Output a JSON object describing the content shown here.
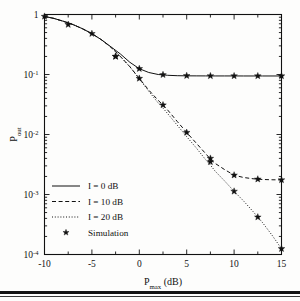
{
  "figure": {
    "background_color": "#fdfdfc",
    "axis_color": "#111111",
    "has_bottom_page_rule": true
  },
  "chart_data": {
    "type": "line",
    "title": "",
    "xlabel": "P_max (dB)",
    "xlabel_main": "P",
    "xlabel_sub": "max",
    "xlabel_unit": " (dB)",
    "ylabel": "P_out",
    "ylabel_main": "P",
    "ylabel_sub": "out",
    "xlim": [
      -10,
      15
    ],
    "ylim": [
      0.0001,
      1
    ],
    "yscale": "log",
    "xscale": "linear",
    "grid": false,
    "legend_position": "lower left",
    "xticks": [
      -10,
      -5,
      0,
      5,
      10,
      15
    ],
    "xtick_labels": [
      "-10",
      "-5",
      "0",
      "5",
      "10",
      "15"
    ],
    "xminor_step": 2.5,
    "yticks": [
      1,
      0.1,
      0.01,
      0.001,
      0.0001
    ],
    "ytick_labels": [
      "1",
      "10-1",
      "10-2",
      "10-3",
      "10-4"
    ],
    "ytick_mantissa": [
      "1",
      "10",
      "10",
      "10",
      "10"
    ],
    "ytick_exponent": [
      "",
      "-1",
      "-2",
      "-3",
      "-4"
    ],
    "series": [
      {
        "name": "I = 0 dB",
        "style": "solid",
        "color": "#111111",
        "x": [
          -10,
          -9,
          -8,
          -7,
          -6,
          -5,
          -4,
          -3,
          -2,
          -1,
          0,
          1,
          2,
          2.5,
          3,
          4,
          5,
          6,
          7,
          7.5,
          8,
          9,
          10,
          11,
          12,
          12.5,
          13,
          14,
          15
        ],
        "y": [
          0.93,
          0.86,
          0.77,
          0.68,
          0.58,
          0.48,
          0.38,
          0.29,
          0.22,
          0.16,
          0.125,
          0.108,
          0.1,
          0.0985,
          0.097,
          0.0955,
          0.095,
          0.0948,
          0.0947,
          0.0947,
          0.0946,
          0.0946,
          0.0946,
          0.0945,
          0.0945,
          0.0945,
          0.0945,
          0.0945,
          0.0945
        ]
      },
      {
        "name": "I = 10 dB",
        "style": "dashed",
        "color": "#111111",
        "x": [
          -10,
          -9,
          -8,
          -7,
          -6,
          -5,
          -4,
          -3,
          -2,
          -1,
          0,
          1,
          2,
          2.5,
          3,
          4,
          5,
          6,
          7,
          7.5,
          8,
          9,
          10,
          11,
          12,
          12.5,
          13,
          14,
          15
        ],
        "y": [
          0.93,
          0.86,
          0.77,
          0.68,
          0.58,
          0.48,
          0.38,
          0.285,
          0.2,
          0.135,
          0.086,
          0.055,
          0.037,
          0.031,
          0.0255,
          0.0165,
          0.0108,
          0.0072,
          0.0048,
          0.0039,
          0.0033,
          0.0026,
          0.0021,
          0.00192,
          0.00183,
          0.0018,
          0.00178,
          0.00176,
          0.00175
        ]
      },
      {
        "name": "I = 20 dB",
        "style": "dotted",
        "color": "#111111",
        "x": [
          -10,
          -9,
          -8,
          -7,
          -6,
          -5,
          -4,
          -3,
          -2,
          -1,
          0,
          1,
          2,
          2.5,
          3,
          4,
          5,
          6,
          7,
          7.5,
          8,
          9,
          10,
          11,
          12,
          12.5,
          13,
          14,
          15
        ],
        "y": [
          0.93,
          0.86,
          0.77,
          0.68,
          0.58,
          0.48,
          0.38,
          0.285,
          0.2,
          0.135,
          0.085,
          0.0525,
          0.0335,
          0.0275,
          0.0222,
          0.0143,
          0.0092,
          0.006,
          0.0038,
          0.0031,
          0.00245,
          0.00168,
          0.00113,
          0.00078,
          0.00052,
          0.00042,
          0.00034,
          0.00021,
          0.000125
        ]
      },
      {
        "name": "Simulation",
        "style": "marker",
        "marker": "star",
        "color": "#111111",
        "x": [
          -10,
          -7.5,
          -5,
          -2.5,
          0,
          2.5,
          5,
          7.5,
          10,
          12.5,
          15,
          -2.5,
          0,
          2.5,
          5,
          7.5,
          10,
          12.5,
          15,
          7.5,
          10,
          12.5,
          15
        ],
        "y": [
          0.93,
          0.68,
          0.48,
          0.2,
          0.125,
          0.099,
          0.0955,
          0.0948,
          0.0947,
          0.0946,
          0.0946,
          0.2,
          0.086,
          0.031,
          0.0108,
          0.004,
          0.0021,
          0.0018,
          0.00175,
          0.0035,
          0.00113,
          0.00042,
          0.000125
        ]
      }
    ],
    "legend": [
      {
        "label": "I = 0 dB",
        "style": "solid"
      },
      {
        "label": "I = 10 dB",
        "style": "dashed"
      },
      {
        "label": "I = 20 dB",
        "style": "dotted"
      },
      {
        "label": "Simulation",
        "style": "marker"
      }
    ]
  }
}
